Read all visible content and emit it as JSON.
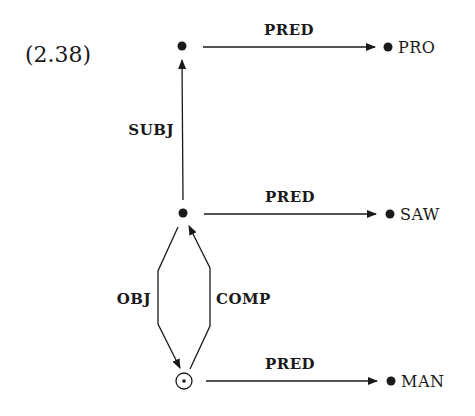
{
  "example_number": "(2.38)",
  "colors": {
    "ink": "#1a1a1a",
    "background": "#ffffff"
  },
  "nodes": {
    "top": {
      "label": "",
      "type": "filled-dot"
    },
    "middle": {
      "label": "",
      "type": "filled-dot"
    },
    "bottom": {
      "label": "",
      "type": "circled-dot"
    }
  },
  "edges": [
    {
      "from": "top",
      "to": "PRO",
      "label": "PRED"
    },
    {
      "from": "middle",
      "to": "top",
      "label": "SUBJ"
    },
    {
      "from": "middle",
      "to": "SAW",
      "label": "PRED"
    },
    {
      "from": "middle",
      "to": "bottom",
      "label": "OBJ"
    },
    {
      "from": "bottom",
      "to": "middle",
      "label": "COMP"
    },
    {
      "from": "bottom",
      "to": "MAN",
      "label": "PRED"
    }
  ],
  "values": {
    "top": "PRO",
    "middle": "SAW",
    "bottom": "MAN"
  }
}
